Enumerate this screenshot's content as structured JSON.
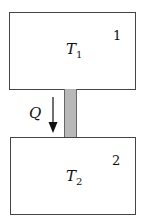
{
  "diagram": {
    "body1": {
      "temperature_label": "T",
      "temperature_subscript": "1",
      "number": "1"
    },
    "body2": {
      "temperature_label": "T",
      "temperature_subscript": "2",
      "number": "2"
    },
    "heat_flow": {
      "label": "Q",
      "direction": "down"
    },
    "colors": {
      "border": "#444444",
      "connector": "#b8b8b8",
      "background": "#ffffff"
    }
  }
}
